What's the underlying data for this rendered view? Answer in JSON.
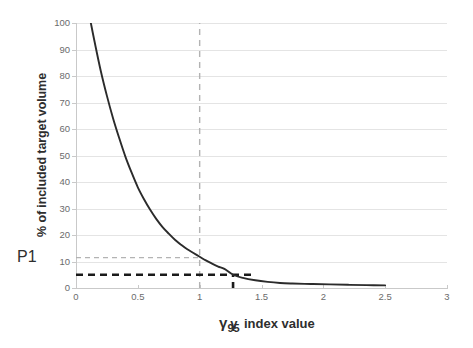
{
  "chart_data": {
    "type": "line",
    "title": "",
    "xlabel": "γ  index value",
    "ylabel": "% of included target volume",
    "xlim": [
      0,
      3
    ],
    "ylim": [
      0,
      100
    ],
    "grid": true,
    "legend": "none",
    "xticks": [
      "0",
      "0.5",
      "1",
      "1.5",
      "2",
      "2.5",
      "3"
    ],
    "xtick_values": [
      0,
      0.5,
      1,
      1.5,
      2,
      2.5,
      3
    ],
    "yticks": [
      "0",
      "10",
      "20",
      "30",
      "40",
      "50",
      "60",
      "70",
      "80",
      "90",
      "100"
    ],
    "ytick_values": [
      0,
      10,
      20,
      30,
      40,
      50,
      60,
      70,
      80,
      90,
      100
    ],
    "series": [
      {
        "name": "gamma index cumulative curve",
        "color": "#2b2b2b",
        "x": [
          0.12,
          0.15,
          0.2,
          0.25,
          0.3,
          0.35,
          0.4,
          0.45,
          0.5,
          0.55,
          0.6,
          0.65,
          0.7,
          0.75,
          0.8,
          0.85,
          0.9,
          0.95,
          1.0,
          1.05,
          1.1,
          1.15,
          1.2,
          1.27,
          1.35,
          1.45,
          1.55,
          1.65,
          1.75,
          1.9,
          2.05,
          2.2,
          2.35,
          2.5
        ],
        "y": [
          100,
          93,
          82,
          72.5,
          64,
          56.5,
          49.5,
          43.5,
          38,
          33.5,
          29.5,
          26,
          23,
          20.5,
          18.2,
          16.3,
          14.6,
          13.2,
          11.8,
          10.4,
          9.2,
          8.1,
          7.2,
          5.0,
          3.8,
          2.9,
          2.3,
          1.9,
          1.7,
          1.5,
          1.35,
          1.2,
          1.1,
          1.0
        ]
      }
    ],
    "annotations": [
      {
        "name": "p1-level-guide",
        "label": "P1",
        "type": "horizontal-guide",
        "y_value": 11.5,
        "x_from": 0,
        "x_to": 1.0,
        "style": "dashed",
        "color": "#b3b3b3"
      },
      {
        "name": "unity-gamma-guide",
        "label": "1",
        "type": "vertical-guide",
        "x_value": 1.0,
        "y_from": 0,
        "y_to": 100,
        "style": "dashed",
        "color": "#b3b3b3"
      },
      {
        "name": "five-percent-guide",
        "label": "5",
        "type": "horizontal-guide",
        "y_value": 5.0,
        "x_from": 0,
        "x_to": 1.42,
        "style": "dashed-bold",
        "color": "#1a1a1a"
      },
      {
        "name": "gamma95-guide",
        "label": "γ",
        "sublabel": "95",
        "type": "vertical-guide",
        "x_value": 1.27,
        "y_from": 0,
        "y_to": 5.0,
        "style": "dashed-bold",
        "color": "#1a1a1a"
      }
    ]
  },
  "labels": {
    "p1": "P1",
    "gamma95_symbol": "γ",
    "gamma95_sub": "95",
    "xaxis_title": "γ index value",
    "yaxis_title": "% of included target volume"
  },
  "colors": {
    "curve": "#2b2b2b",
    "grid": "#e4e4e4",
    "axis": "#c9c9c9",
    "guide_light": "#b3b3b3",
    "guide_bold": "#1a1a1a",
    "text": "#2e2e2e",
    "tick_text": "#6b6b6b",
    "background": "#ffffff"
  }
}
